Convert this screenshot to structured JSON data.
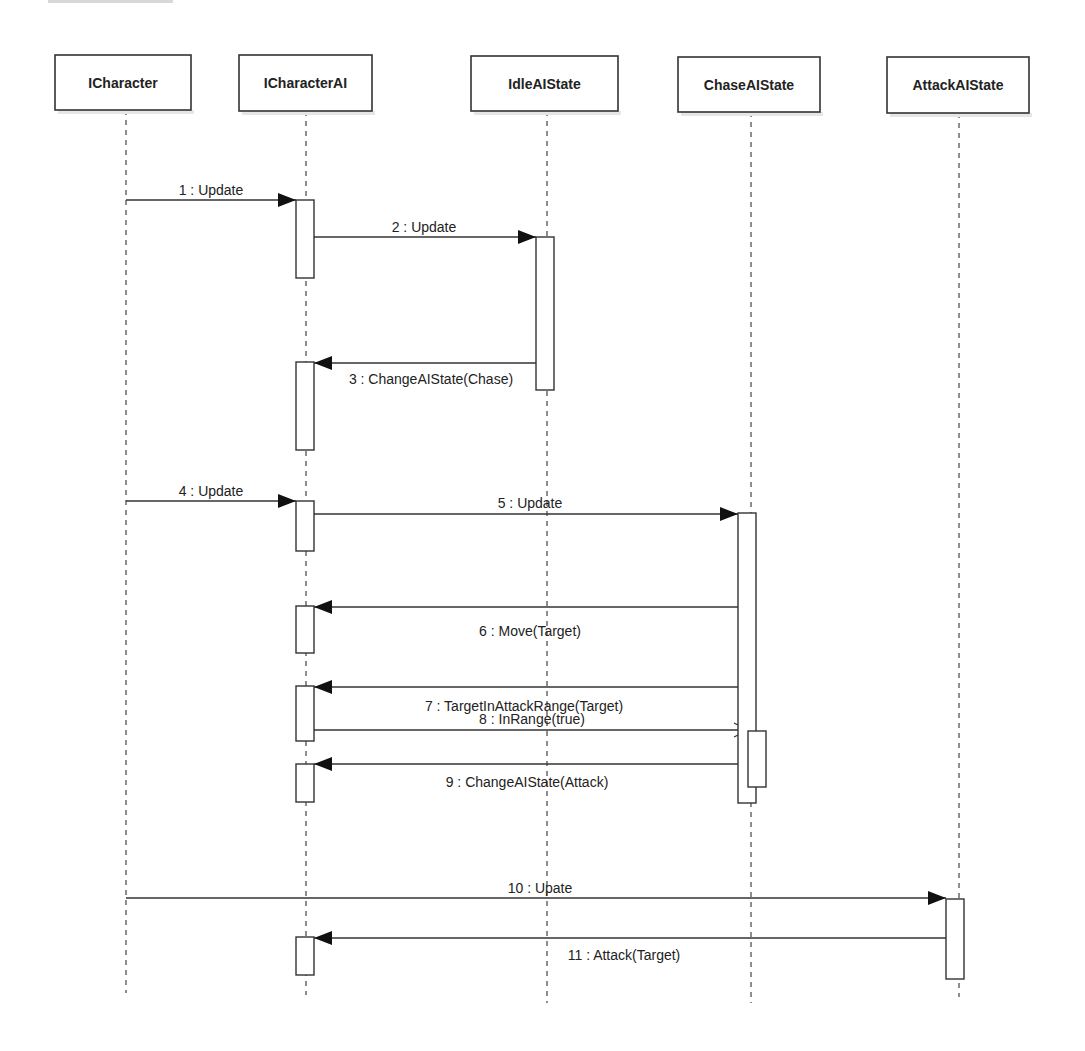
{
  "diagram": {
    "type": "uml-sequence",
    "participants": [
      {
        "id": "icharacter",
        "label": "ICharacter",
        "box": [
          55,
          55,
          136,
          55
        ],
        "lifeline_x": 126,
        "lifeline_end": 993
      },
      {
        "id": "icharacterai",
        "label": "ICharacterAI",
        "box": [
          239,
          55,
          133,
          56
        ],
        "lifeline_x": 306,
        "lifeline_end": 995
      },
      {
        "id": "idleaistate",
        "label": "IdleAIState",
        "box": [
          471,
          56,
          147,
          55
        ],
        "lifeline_x": 547,
        "lifeline_end": 1003
      },
      {
        "id": "chaseaistate",
        "label": "ChaseAIState",
        "box": [
          678,
          57,
          142,
          55
        ],
        "lifeline_x": 751,
        "lifeline_end": 1003
      },
      {
        "id": "attackaistate",
        "label": "AttackAIState",
        "box": [
          887,
          57,
          142,
          56
        ],
        "lifeline_x": 959,
        "lifeline_end": 997
      }
    ],
    "activations": [
      {
        "participant": "icharacterai",
        "x": 296,
        "y": 200,
        "w": 18,
        "h": 78
      },
      {
        "participant": "idleaistate",
        "x": 536,
        "y": 237,
        "w": 18,
        "h": 153
      },
      {
        "participant": "icharacterai",
        "x": 296,
        "y": 362,
        "w": 18,
        "h": 88
      },
      {
        "participant": "icharacterai",
        "x": 296,
        "y": 501,
        "w": 18,
        "h": 50
      },
      {
        "participant": "chaseaistate",
        "x": 738,
        "y": 513,
        "w": 18,
        "h": 290
      },
      {
        "participant": "icharacterai",
        "x": 296,
        "y": 606,
        "w": 18,
        "h": 47
      },
      {
        "participant": "icharacterai",
        "x": 296,
        "y": 686,
        "w": 18,
        "h": 55
      },
      {
        "participant": "chaseaistate",
        "x": 748,
        "y": 731,
        "w": 18,
        "h": 56
      },
      {
        "participant": "icharacterai",
        "x": 296,
        "y": 764,
        "w": 18,
        "h": 38
      },
      {
        "participant": "attackaistate",
        "x": 946,
        "y": 899,
        "w": 18,
        "h": 80
      },
      {
        "participant": "icharacterai",
        "x": 296,
        "y": 937,
        "w": 18,
        "h": 38
      }
    ],
    "messages": [
      {
        "n": 1,
        "label": "1 : Update",
        "from_x": 126,
        "to_x": 296,
        "y": 200,
        "head": "filled",
        "label_x": 211,
        "label_y": 195
      },
      {
        "n": 2,
        "label": "2 : Update",
        "from_x": 314,
        "to_x": 536,
        "y": 237,
        "head": "filled",
        "label_x": 424,
        "label_y": 232
      },
      {
        "n": 3,
        "label": "3 : ChangeAIState(Chase)",
        "from_x": 536,
        "to_x": 314,
        "y": 363,
        "head": "filled",
        "label_x": 431,
        "label_y": 384
      },
      {
        "n": 4,
        "label": "4 : Update",
        "from_x": 126,
        "to_x": 296,
        "y": 501,
        "head": "filled",
        "label_x": 211,
        "label_y": 496
      },
      {
        "n": 5,
        "label": "5 : Update",
        "from_x": 314,
        "to_x": 738,
        "y": 514,
        "head": "filled",
        "label_x": 530,
        "label_y": 508
      },
      {
        "n": 6,
        "label": "6 : Move(Target)",
        "from_x": 738,
        "to_x": 314,
        "y": 607,
        "head": "filled",
        "label_x": 530,
        "label_y": 636
      },
      {
        "n": 7,
        "label": "7 : TargetInAttackRange(Target)",
        "from_x": 738,
        "to_x": 314,
        "y": 687,
        "head": "filled",
        "label_x": 524,
        "label_y": 711
      },
      {
        "n": 8,
        "label": "8 : InRange(true)",
        "from_x": 314,
        "to_x": 748,
        "y": 730,
        "head": "open",
        "label_x": 532,
        "label_y": 724
      },
      {
        "n": 9,
        "label": "9 : ChangeAIState(Attack)",
        "from_x": 748,
        "to_x": 314,
        "y": 764,
        "head": "filled",
        "label_x": 527,
        "label_y": 787
      },
      {
        "n": 10,
        "label": "10 : Upate",
        "from_x": 126,
        "to_x": 946,
        "y": 898,
        "head": "filled",
        "label_x": 540,
        "label_y": 893
      },
      {
        "n": 11,
        "label": "11 : Attack(Target)",
        "from_x": 946,
        "to_x": 314,
        "y": 938,
        "head": "filled",
        "label_x": 624,
        "label_y": 960
      }
    ]
  }
}
